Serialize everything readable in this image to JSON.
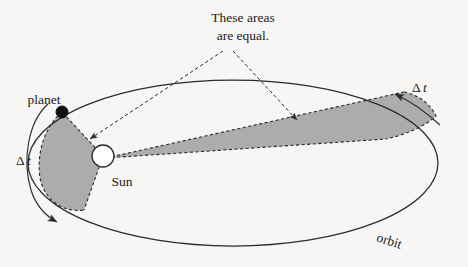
{
  "figure": {
    "title_note_line1": "These areas",
    "title_note_line2": "are equal.",
    "labels": {
      "planet": "planet",
      "sun": "Sun",
      "orbit": "orbit",
      "delta_t_left_symbol": "Δ",
      "delta_t_left_variable": "t",
      "delta_t_right_symbol": "Δ",
      "delta_t_right_variable": "t"
    },
    "colors": {
      "background": "#f7f6f4",
      "ink": "#2b2b2b",
      "swept_area_fill": "#a8a8a8",
      "sun_fill": "#ffffff",
      "planet_fill": "#111111"
    },
    "geometry": {
      "orbit_center_x": 233,
      "orbit_center_y": 163,
      "orbit_radius_x": 205,
      "orbit_radius_y": 83,
      "sun_center_x": 103,
      "sun_center_y": 156,
      "sun_radius": 11,
      "planet_center_x": 62,
      "planet_center_y": 112,
      "planet_radius": 6
    },
    "annotations": {
      "left_sweep_caption": "Δt",
      "right_sweep_caption": "Δt",
      "equal_areas_leader_count": 2
    }
  }
}
